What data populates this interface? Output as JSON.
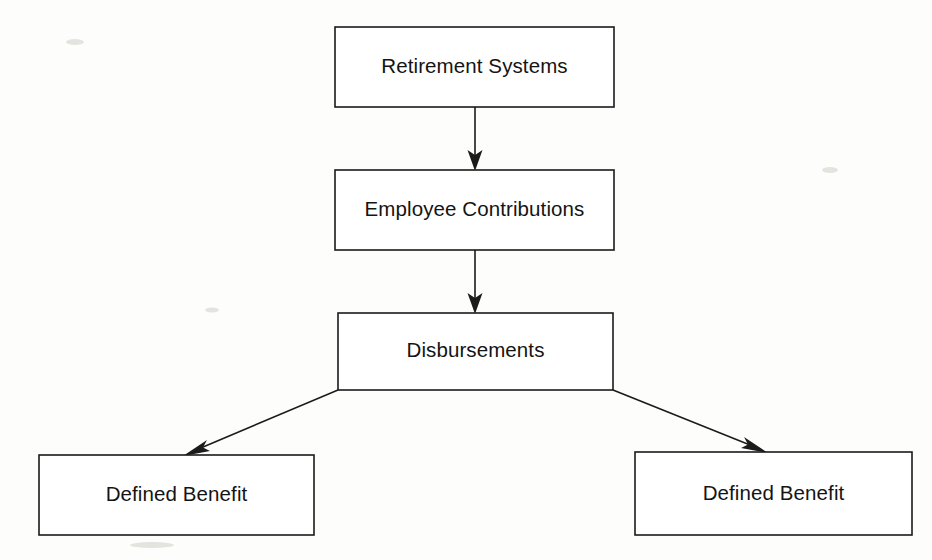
{
  "diagram": {
    "background_color": "#fdfdfb",
    "stroke_color": "#1b1b1b",
    "box_fill_color": "#ffffff",
    "nodes": [
      {
        "id": "retirement-systems",
        "label": "Retirement Systems",
        "x": 335,
        "y": 27,
        "width": 279,
        "height": 80
      },
      {
        "id": "employee-contributions",
        "label": "Employee Contributions",
        "x": 335,
        "y": 170,
        "width": 279,
        "height": 80
      },
      {
        "id": "disbursements",
        "label": "Disbursements",
        "x": 338,
        "y": 313,
        "width": 275,
        "height": 77
      },
      {
        "id": "defined-benefit-left",
        "label": "Defined Benefit",
        "x": 39,
        "y": 455,
        "width": 275,
        "height": 80
      },
      {
        "id": "defined-benefit-right",
        "label": "Defined Benefit",
        "x": 635,
        "y": 452,
        "width": 277,
        "height": 83
      }
    ],
    "edges": [
      {
        "id": "edge-retirement-to-contributions",
        "from": "retirement-systems",
        "to": "employee-contributions",
        "kind": "vertical-arrow",
        "x1": 475,
        "y1": 107,
        "x2": 475,
        "y2": 170
      },
      {
        "id": "edge-contributions-to-disbursements",
        "from": "employee-contributions",
        "to": "disbursements",
        "kind": "vertical-arrow",
        "x1": 475,
        "y1": 250,
        "x2": 475,
        "y2": 313
      },
      {
        "id": "edge-disbursements-to-left-benefit",
        "from": "disbursements",
        "to": "defined-benefit-left",
        "kind": "diagonal-arrow",
        "x1": 338,
        "y1": 390,
        "x2": 185,
        "y2": 455
      },
      {
        "id": "edge-disbursements-to-right-benefit",
        "from": "disbursements",
        "to": "defined-benefit-right",
        "kind": "diagonal-arrow",
        "x1": 613,
        "y1": 390,
        "x2": 766,
        "y2": 452
      }
    ]
  }
}
